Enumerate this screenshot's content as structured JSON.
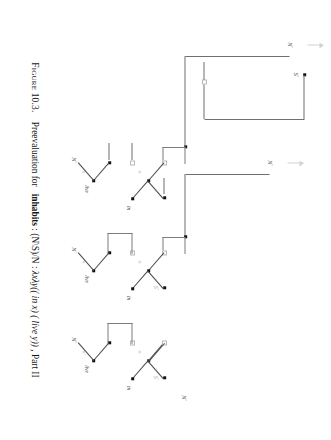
{
  "figure": {
    "caption_label": "Figure 10.3.",
    "caption_lead": "Preevaluation for",
    "caption_word": "inhabits",
    "caption_colon": " : ",
    "caption_type": "(N\\S)/N",
    "caption_type_sep": " : ",
    "caption_term_a": "λxλy((",
    "caption_term_in": "in",
    "caption_term_b": " x) (",
    "caption_term_live": "live",
    "caption_term_c": " y))",
    "caption_tail": ", Part II"
  },
  "colors": {
    "ink": "#1a1a1a",
    "edge": "#4a4a4a",
    "wire": "#6f6f6f",
    "dim": "#9d9d9d",
    "arrow": "#d2d2d2",
    "paper": "#ffffff"
  },
  "trees": [
    {
      "id": "tree-1",
      "conclusion_label": "N",
      "conclusion_sup": "◦",
      "hypothesis_label": "S",
      "hypothesis_sup": "◦",
      "leaf_label": "N",
      "leaf_sup": "◦",
      "word_in": "in",
      "word_live": "live",
      "link_symbols": [
        "≡",
        "≡",
        "≡"
      ],
      "open_nodes": 3,
      "filled_nodes": 6
    },
    {
      "id": "tree-2",
      "conclusion_label": "N",
      "conclusion_sup": "◦",
      "hypothesis_label": "S",
      "hypothesis_sup": "◦",
      "leaf_label": "N",
      "leaf_sup": "◦",
      "word_in": "in",
      "word_live": "live",
      "link_symbols": [
        "≡",
        "≡",
        "≡"
      ],
      "open_nodes": 3,
      "filled_nodes": 6
    },
    {
      "id": "tree-3",
      "conclusion_label": "N",
      "conclusion_sup": "◦",
      "hypothesis_label": "S",
      "hypothesis_sup": "◦",
      "leaf_label": "N",
      "leaf_sup": "◦",
      "word_in": "in",
      "word_live": "live",
      "link_symbols": [
        "≡",
        "≡",
        "≡"
      ],
      "open_nodes": 2,
      "filled_nodes": 5
    }
  ]
}
